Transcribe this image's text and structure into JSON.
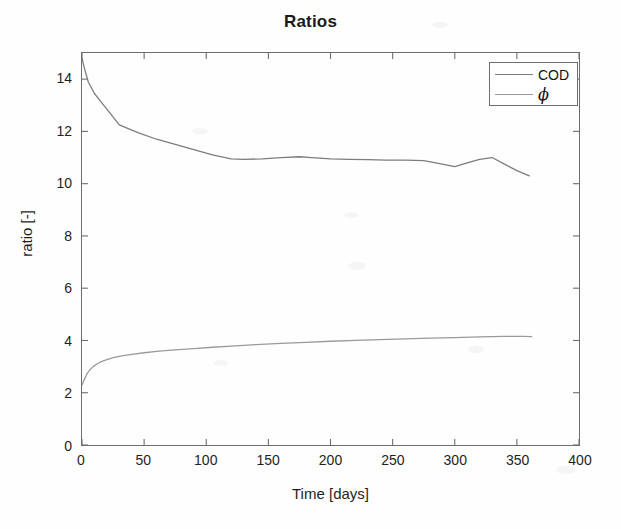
{
  "figure": {
    "title": "Ratios",
    "background_color": "#fefefe",
    "axis_color": "#6e6e6e"
  },
  "axes": {
    "x_label": "Time [days]",
    "y_label": "ratio [-]",
    "x_ticks": [
      "0",
      "50",
      "100",
      "150",
      "200",
      "250",
      "300",
      "350",
      "400"
    ],
    "y_ticks": [
      "0",
      "2",
      "4",
      "6",
      "8",
      "10",
      "12",
      "14"
    ]
  },
  "legend": {
    "position": "top-right",
    "entries": [
      {
        "label": "COD",
        "color": "#7d7d7d",
        "symbol": false
      },
      {
        "label": "ϕ",
        "color": "#9a9a9a",
        "symbol": true
      }
    ]
  },
  "chart_data": {
    "type": "line",
    "title": "Ratios",
    "xlabel": "Time [days]",
    "ylabel": "ratio [-]",
    "xlim": [
      0,
      400
    ],
    "ylim": [
      0,
      15
    ],
    "xticks": [
      0,
      50,
      100,
      150,
      200,
      250,
      300,
      350,
      400
    ],
    "yticks": [
      0,
      2,
      4,
      6,
      8,
      10,
      12,
      14
    ],
    "grid": false,
    "legend_position": "upper right",
    "series": [
      {
        "name": "COD",
        "color": "#7d7d7d",
        "x": [
          0,
          2,
          5,
          10,
          15,
          20,
          30,
          45,
          60,
          75,
          90,
          105,
          120,
          130,
          145,
          160,
          175,
          185,
          200,
          215,
          230,
          245,
          260,
          275,
          290,
          300,
          310,
          320,
          330,
          340,
          350,
          360
        ],
        "y": [
          14.8,
          14.4,
          13.9,
          13.45,
          13.15,
          12.85,
          12.25,
          11.95,
          11.7,
          11.5,
          11.3,
          11.1,
          10.95,
          10.93,
          10.95,
          11.0,
          11.03,
          11.0,
          10.95,
          10.93,
          10.92,
          10.9,
          10.9,
          10.88,
          10.75,
          10.65,
          10.8,
          10.93,
          11.0,
          10.75,
          10.5,
          10.3
        ]
      },
      {
        "name": "ϕ",
        "color": "#9a9a9a",
        "x": [
          0,
          2,
          4,
          6,
          9,
          12,
          16,
          20,
          26,
          32,
          40,
          50,
          62,
          75,
          90,
          105,
          120,
          140,
          160,
          180,
          200,
          220,
          240,
          260,
          280,
          300,
          320,
          340,
          355,
          362
        ],
        "y": [
          2.3,
          2.52,
          2.72,
          2.86,
          3.0,
          3.1,
          3.2,
          3.27,
          3.35,
          3.41,
          3.47,
          3.53,
          3.59,
          3.64,
          3.69,
          3.74,
          3.78,
          3.84,
          3.89,
          3.93,
          3.97,
          4.0,
          4.03,
          4.06,
          4.09,
          4.11,
          4.14,
          4.16,
          4.16,
          4.15
        ]
      }
    ]
  }
}
